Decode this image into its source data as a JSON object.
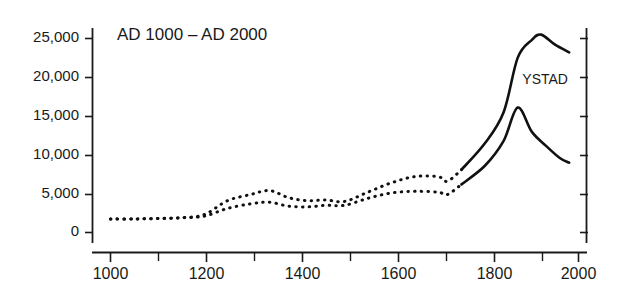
{
  "figure": {
    "title": "AD 1000 – AD 2000",
    "background_color": "#ffffff",
    "ink_color": "#111111"
  },
  "chart_data": {
    "type": "line",
    "title": "AD 1000 – AD 2000",
    "subtitle": "",
    "xlabel": "",
    "ylabel": "",
    "xlim": [
      1000,
      2000
    ],
    "ylim": [
      0,
      27000
    ],
    "grid": false,
    "legend_position": "inline-annotation",
    "x_ticks": [
      1000,
      1200,
      1400,
      1600,
      1800,
      2000
    ],
    "x_tick_labels": [
      "1000",
      "1200",
      "1400",
      "1600",
      "1800",
      "2000"
    ],
    "x_minor_ticks": [
      1100,
      1300,
      1500,
      1700,
      1900
    ],
    "y_ticks": [
      0,
      5000,
      10000,
      15000,
      20000,
      25000
    ],
    "y_tick_labels": [
      "0",
      "5,000",
      "10,000",
      "15,000",
      "20,000",
      "25,000"
    ],
    "annotations": [
      {
        "text": "YSTAD",
        "x": 1880,
        "y": 19200
      }
    ],
    "line_style_note": "dotted (estimated) before AD 1750, solid (recorded) after AD 1750",
    "series": [
      {
        "name": "upper",
        "style_segments": [
          {
            "style": "dotted",
            "from": 1000,
            "to": 1750
          },
          {
            "style": "solid",
            "from": 1750,
            "to": 1980
          }
        ],
        "x": [
          1000,
          1050,
          1100,
          1150,
          1200,
          1250,
          1300,
          1340,
          1380,
          1420,
          1460,
          1500,
          1550,
          1600,
          1650,
          1700,
          1720,
          1750,
          1800,
          1840,
          1870,
          1900,
          1920,
          1950,
          1980
        ],
        "values": [
          1750,
          1750,
          1800,
          1900,
          2300,
          4100,
          4900,
          5400,
          4500,
          4100,
          4200,
          4000,
          5200,
          6400,
          7200,
          7200,
          6600,
          8100,
          11500,
          15500,
          22500,
          24800,
          25500,
          24200,
          23200
        ]
      },
      {
        "name": "lower",
        "style_segments": [
          {
            "style": "dotted",
            "from": 1000,
            "to": 1750
          },
          {
            "style": "solid",
            "from": 1750,
            "to": 1980
          }
        ],
        "x": [
          1000,
          1050,
          1100,
          1150,
          1200,
          1250,
          1300,
          1340,
          1380,
          1420,
          1460,
          1500,
          1550,
          1600,
          1650,
          1700,
          1720,
          1750,
          1800,
          1840,
          1870,
          1900,
          1930,
          1960,
          1980
        ],
        "values": [
          1750,
          1750,
          1800,
          1900,
          2100,
          3100,
          3700,
          3900,
          3400,
          3300,
          3500,
          3500,
          4400,
          5100,
          5300,
          5200,
          4900,
          6200,
          8600,
          11800,
          16100,
          13000,
          11200,
          9600,
          9000
        ]
      }
    ]
  }
}
